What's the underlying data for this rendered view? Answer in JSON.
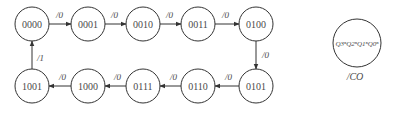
{
  "diagram": {
    "type": "state-transition-diagram",
    "colors": {
      "stroke": "#333333",
      "text": "#4a4a4a",
      "background": "#ffffff"
    },
    "states": [
      {
        "id": "s0",
        "label": "0000"
      },
      {
        "id": "s1",
        "label": "0001"
      },
      {
        "id": "s2",
        "label": "0010"
      },
      {
        "id": "s3",
        "label": "0011"
      },
      {
        "id": "s4",
        "label": "0100"
      },
      {
        "id": "s5",
        "label": "0101"
      },
      {
        "id": "s6",
        "label": "0110"
      },
      {
        "id": "s7",
        "label": "0111"
      },
      {
        "id": "s8",
        "label": "1000"
      },
      {
        "id": "s9",
        "label": "1001"
      }
    ],
    "transitions": [
      {
        "from": "0000",
        "to": "0001",
        "label": "/0"
      },
      {
        "from": "0001",
        "to": "0010",
        "label": "/0"
      },
      {
        "from": "0010",
        "to": "0011",
        "label": "/0"
      },
      {
        "from": "0011",
        "to": "0100",
        "label": "/0"
      },
      {
        "from": "0100",
        "to": "0101",
        "label": "/0"
      },
      {
        "from": "0101",
        "to": "0110",
        "label": "/0"
      },
      {
        "from": "0110",
        "to": "0111",
        "label": "/0"
      },
      {
        "from": "0111",
        "to": "1000",
        "label": "/0"
      },
      {
        "from": "1000",
        "to": "1001",
        "label": "/0"
      },
      {
        "from": "1001",
        "to": "0000",
        "label": "/1"
      }
    ],
    "legend": {
      "state_format": "Q3ⁿQ2ⁿQ1ⁿQ0ⁿ",
      "output_label": "/CO"
    }
  }
}
